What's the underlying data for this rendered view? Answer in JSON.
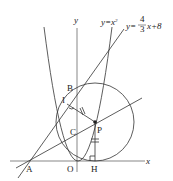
{
  "figure": {
    "axes": {
      "x_label": "x",
      "y_label": "y"
    },
    "curves": {
      "parabola_label": "y = x²",
      "parabola_eq_lhs": "y=x",
      "parabola_exp": "2",
      "line_label_prefix": "y=",
      "line_frac_num": "4",
      "line_frac_den": "3",
      "line_label_suffix": "x+8"
    },
    "points": {
      "A": "A",
      "B": "B",
      "C": "C",
      "I": "I",
      "P": "P",
      "O": "O",
      "H": "H"
    },
    "colors": {
      "stroke": "#333333",
      "background": "#ffffff"
    }
  }
}
